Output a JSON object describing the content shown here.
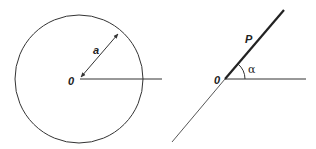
{
  "diagram": {
    "left_figure": {
      "description": "Circle with radius a centered at origin O",
      "center_label": "0",
      "radius_label": "a",
      "center": [
        79,
        79
      ],
      "radius": 64,
      "axis_end_x": 162,
      "radius_arrow_end": [
        119,
        32
      ]
    },
    "right_figure": {
      "description": "Ray OP at angle alpha from horizontal axis",
      "origin_label": "0",
      "point_label": "P",
      "angle_label": "α",
      "origin": [
        225,
        79
      ],
      "ray_end": [
        284,
        10
      ],
      "extension_end": [
        172,
        142
      ],
      "axis_end_x": 306
    },
    "colors": {
      "stroke": "#333333",
      "background": "#ffffff"
    }
  }
}
